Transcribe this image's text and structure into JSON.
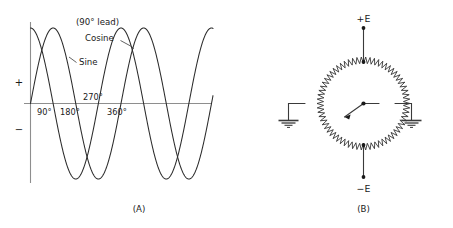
{
  "figure": {
    "panels": [
      {
        "id": "panel-a",
        "caption": "(A)",
        "annotations": {
          "lead_note": "(90° lead)",
          "cosine_label": "Cosine",
          "sine_label": "Sine"
        },
        "axis": {
          "positive_marker": "+",
          "negative_marker": "−",
          "degree_ticks": [
            "90°",
            "180°",
            "270°",
            "360°"
          ]
        }
      },
      {
        "id": "panel-b",
        "caption": "(B)",
        "terminals": {
          "top": "+E",
          "bottom": "−E"
        },
        "ground_left": "chassis-ground",
        "ground_right": "chassis-ground"
      }
    ]
  },
  "chart_data": {
    "type": "line",
    "title": "",
    "xlabel": "",
    "ylabel": "",
    "x_unit": "degrees",
    "xlim": [
      0,
      720
    ],
    "ylim": [
      -1,
      1
    ],
    "grid": false,
    "legend": "inline-callouts",
    "axis_markers": {
      "positive": "+",
      "negative": "−"
    },
    "tick_labels": [
      "90°",
      "180°",
      "270°",
      "360°"
    ],
    "tick_values": [
      90,
      180,
      270,
      360
    ],
    "annotations": [
      {
        "text": "(90° lead)",
        "refers_to": "Cosine"
      },
      {
        "text": "Cosine",
        "refers_to": "cosine-curve"
      },
      {
        "text": "Sine",
        "refers_to": "sine-curve"
      }
    ],
    "series": [
      {
        "name": "Sine",
        "phase_deg": 0,
        "amplitude": 1,
        "cycles": 2,
        "description": "sin(theta)"
      },
      {
        "name": "Cosine",
        "phase_deg": 90,
        "amplitude": 1,
        "cycles": 2,
        "description": "cos(theta), leads sine by 90 degrees"
      }
    ]
  }
}
